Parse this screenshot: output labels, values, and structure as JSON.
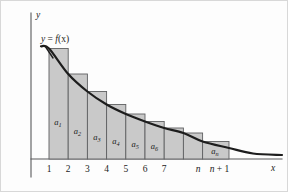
{
  "figure": {
    "kind": "integral-test-diagram",
    "background_color": "#fdfdfd",
    "border_color": "#d8d8d8",
    "bar_fill_color": "#c9c9c9",
    "bar_stroke_color": "#5f6062",
    "curve_color": "#1d1d1d",
    "axis_color": "#58595b"
  },
  "axes": {
    "y_axis_label": "y",
    "x_axis_label": "x",
    "y_axis_x_px": 30,
    "y_axis_top_px": 12,
    "y_axis_bottom_px": 176,
    "x_axis_y_px": 158,
    "x_axis_left_px": 30,
    "x_axis_right_px": 281
  },
  "curve_label": {
    "prefix": "y",
    "equals": " = ",
    "func": "f",
    "arg": "(x)",
    "full_text": "y = f(x)",
    "x_px": 40,
    "y_px": 41
  },
  "ticks": [
    {
      "label": "1",
      "x_px": 48.0,
      "italic": false
    },
    {
      "label": "2",
      "x_px": 67.2,
      "italic": false
    },
    {
      "label": "3",
      "x_px": 86.4,
      "italic": false
    },
    {
      "label": "4",
      "x_px": 105.6,
      "italic": false
    },
    {
      "label": "5",
      "x_px": 124.8,
      "italic": false
    },
    {
      "label": "6",
      "x_px": 144.0,
      "italic": false
    },
    {
      "label": "7",
      "x_px": 163.2,
      "italic": false
    },
    {
      "label": "n",
      "x_px": 197.0,
      "italic": true
    },
    {
      "label": "n + 1",
      "x_px": 218.5,
      "italic": true
    }
  ],
  "chart_data": {
    "type": "bar",
    "title": "",
    "subtitle": "",
    "xlabel": "x",
    "ylabel": "y",
    "grid": false,
    "legend": "none",
    "xlim": [
      0,
      13
    ],
    "ylim": [
      0,
      1.1
    ],
    "categories": [
      "a1",
      "a2",
      "a3",
      "a4",
      "a5",
      "a6",
      "a7",
      "a8",
      "an"
    ],
    "bar_labels": [
      "a₁",
      "a₂",
      "a₃",
      "a₄",
      "a₅",
      "a₆",
      "",
      "",
      "aₙ"
    ],
    "values": [
      0.76,
      0.56,
      0.44,
      0.36,
      0.3,
      0.26,
      0.22,
      0.19,
      0.135
    ],
    "bars": [
      {
        "label_base": "a",
        "label_sub": "1",
        "x0_px": 48.0,
        "x1_px": 67.2,
        "top_px": 47.5,
        "label_x_px": 57.0,
        "label_y_px": 124.0,
        "show_label": true
      },
      {
        "label_base": "a",
        "label_sub": "2",
        "x0_px": 67.2,
        "x1_px": 86.4,
        "top_px": 73.0,
        "label_x_px": 76.5,
        "label_y_px": 133.0,
        "show_label": true
      },
      {
        "label_base": "a",
        "label_sub": "3",
        "x0_px": 86.4,
        "x1_px": 105.6,
        "top_px": 90.5,
        "label_x_px": 95.8,
        "label_y_px": 139.0,
        "show_label": true
      },
      {
        "label_base": "a",
        "label_sub": "4",
        "x0_px": 105.6,
        "x1_px": 124.8,
        "top_px": 103.5,
        "label_x_px": 115.0,
        "label_y_px": 142.5,
        "show_label": true
      },
      {
        "label_base": "a",
        "label_sub": "5",
        "x0_px": 124.8,
        "x1_px": 144.0,
        "top_px": 113.0,
        "label_x_px": 134.2,
        "label_y_px": 145.5,
        "show_label": true
      },
      {
        "label_base": "a",
        "label_sub": "6",
        "x0_px": 144.0,
        "x1_px": 163.2,
        "top_px": 120.5,
        "label_x_px": 153.5,
        "label_y_px": 147.5,
        "show_label": true
      },
      {
        "label_base": "a",
        "label_sub": "",
        "x0_px": 163.2,
        "x1_px": 182.4,
        "top_px": 127.0,
        "label_x_px": 172.8,
        "label_y_px": 150.0,
        "show_label": false
      },
      {
        "label_base": "a",
        "label_sub": "",
        "x0_px": 182.4,
        "x1_px": 201.6,
        "top_px": 132.0,
        "label_x_px": 192.0,
        "label_y_px": 151.0,
        "show_label": false
      },
      {
        "label_base": "a",
        "label_sub": "n",
        "x0_px": 201.6,
        "x1_px": 228.0,
        "top_px": 140.5,
        "label_x_px": 214.0,
        "label_y_px": 153.0,
        "show_label": true
      }
    ]
  }
}
